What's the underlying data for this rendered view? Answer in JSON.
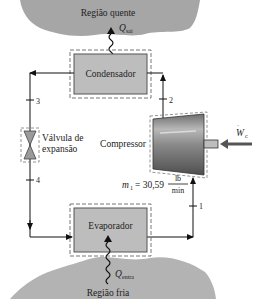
{
  "diagram": {
    "regions": {
      "hot": {
        "label": "Região quente",
        "color": "#a6a6a6"
      },
      "cold": {
        "label": "Região fria",
        "color": "#b3b3b3"
      }
    },
    "heat_flows": {
      "out": {
        "symbol": "Q",
        "sub": "sai"
      },
      "in": {
        "symbol": "Q",
        "sub": "entra"
      }
    },
    "components": {
      "condenser": {
        "label": "Condensador",
        "fill": "#bdbdbd"
      },
      "evaporator": {
        "label": "Evaporador",
        "fill": "#bdbdbd"
      },
      "valve": {
        "label_line1": "Válvula de",
        "label_line2": "expansão"
      },
      "compressor": {
        "label": "Compressor"
      }
    },
    "work": {
      "symbol": "W",
      "sub": "c"
    },
    "states": [
      "1",
      "2",
      "3",
      "4"
    ],
    "mass_flow": {
      "symbol": "m",
      "sub": "1",
      "equals": "= 30,59",
      "unit_num": "lb",
      "unit_den": "min"
    }
  }
}
